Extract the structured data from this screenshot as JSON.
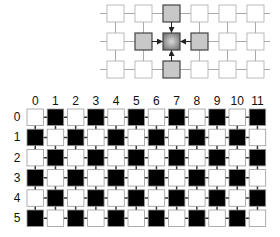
{
  "top_diagram": {
    "description": "Neighborhood diagram: center cell receives arrows from its 4 neighbors",
    "cols": 6,
    "rows": 3,
    "center": {
      "row": 1,
      "col": 2
    },
    "neighbors": [
      {
        "row": 0,
        "col": 2
      },
      {
        "row": 1,
        "col": 1
      },
      {
        "row": 1,
        "col": 3
      },
      {
        "row": 2,
        "col": 2
      }
    ],
    "colors": {
      "empty": "#ffffff",
      "neighbor": "#c8c8c8",
      "center": "#8a8a8a",
      "line": "#aaaaaa",
      "arrow": "#222222"
    }
  },
  "bottom_grid": {
    "description": "Checkerboard grid: black where (row+col) is odd",
    "col_labels": [
      "0",
      "1",
      "2",
      "3",
      "4",
      "5",
      "6",
      "7",
      "8",
      "9",
      "10",
      "11"
    ],
    "row_labels": [
      "0",
      "1",
      "2",
      "3",
      "4",
      "5"
    ],
    "colors": {
      "black": "#000000",
      "white": "#ffffff",
      "border": "#999999",
      "link": "#333333"
    }
  }
}
